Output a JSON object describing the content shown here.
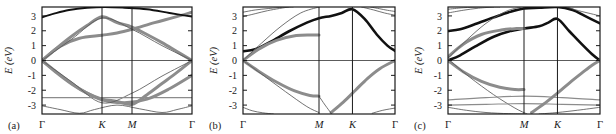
{
  "figure": {
    "type": "band-structure-figure",
    "panel_count": 3,
    "background_color": "#ffffff"
  },
  "axes": {
    "ylabel": "E (eV)",
    "yticks": [
      "3",
      "2",
      "1",
      "0",
      "-1",
      "-2",
      "-3"
    ],
    "ytick_values": [
      3,
      2,
      1,
      0,
      -1,
      -2,
      -3
    ],
    "ylim": [
      -3.6,
      3.6
    ],
    "tick_color": "#1a1a1a",
    "frame_color": "#1a1a1a",
    "band_gray": "#8c8c8c",
    "band_dark": "#111111",
    "thin_line": "#5a5a5a"
  },
  "panels": [
    {
      "id": "a",
      "tag": "(a)",
      "xticks": [
        "Γ",
        "K",
        "M",
        "Γ"
      ],
      "xtick_fracs": [
        0,
        0.4,
        0.6,
        1.0
      ],
      "chart_data": {
        "type": "line",
        "title": "",
        "xlabel": "",
        "ylabel": "E (eV)",
        "ylim": [
          -3.6,
          3.6
        ],
        "xlim": [
          0,
          1
        ],
        "grid": false,
        "xticklabels": [
          "Γ",
          "K",
          "M",
          "Γ"
        ],
        "xtickpos": [
          0,
          0.4,
          0.6,
          1.0
        ],
        "legend": "none",
        "series": [
          {
            "name": "dirac-upper-gray",
            "style": "thick-gray",
            "x": [
              0.0,
              0.1,
              0.2,
              0.3,
              0.4,
              0.5,
              0.6,
              0.7,
              0.8,
              0.9,
              1.0
            ],
            "y": [
              0.0,
              0.85,
              1.65,
              2.35,
              2.95,
              2.55,
              2.25,
              1.75,
              1.2,
              0.6,
              0.0
            ]
          },
          {
            "name": "dirac-lower-gray",
            "style": "thick-gray",
            "x": [
              0.0,
              0.1,
              0.2,
              0.3,
              0.4,
              0.5,
              0.6,
              0.7,
              0.8,
              0.9,
              1.0
            ],
            "y": [
              0.0,
              -0.85,
              -1.6,
              -2.2,
              -2.6,
              -2.75,
              -2.95,
              -2.3,
              -1.55,
              -0.8,
              0.0
            ]
          },
          {
            "name": "flat-band-gray",
            "style": "thick-gray",
            "x": [
              0.0,
              0.12,
              0.25,
              0.4,
              0.5,
              0.6,
              0.75,
              0.88,
              1.0
            ],
            "y": [
              0.0,
              0.95,
              1.5,
              1.7,
              1.85,
              2.1,
              2.55,
              2.9,
              3.25
            ]
          },
          {
            "name": "mid-gray-cross",
            "style": "thick-gray",
            "x": [
              0.0,
              0.12,
              0.25,
              0.4,
              0.55,
              0.7,
              0.85,
              1.0
            ],
            "y": [
              0.0,
              -0.95,
              -1.9,
              -2.65,
              -2.85,
              -2.6,
              -1.9,
              -1.0
            ]
          },
          {
            "name": "upper-dark",
            "style": "dark",
            "x": [
              0.0,
              0.08,
              0.18,
              0.3,
              0.42,
              0.55,
              0.7,
              0.85,
              1.0
            ],
            "y": [
              2.9,
              3.15,
              3.4,
              3.55,
              3.6,
              3.55,
              3.45,
              3.2,
              2.95
            ]
          },
          {
            "name": "steep-thin-1",
            "style": "thin",
            "x": [
              0.0,
              0.2,
              0.4,
              0.6,
              0.8,
              1.0
            ],
            "y": [
              0.0,
              1.45,
              2.85,
              2.1,
              1.0,
              0.0
            ]
          },
          {
            "name": "steep-thin-2",
            "style": "thin",
            "x": [
              0.0,
              0.2,
              0.4,
              0.6,
              0.8,
              1.0
            ],
            "y": [
              0.0,
              -1.45,
              -2.85,
              -2.2,
              -1.05,
              0.0
            ]
          },
          {
            "name": "lower-thin-dip",
            "style": "thin",
            "x": [
              0.0,
              0.12,
              0.25,
              0.35,
              0.5,
              0.65,
              0.8,
              0.9,
              1.0
            ],
            "y": [
              -3.05,
              -3.3,
              -3.55,
              -3.3,
              -3.0,
              -3.25,
              -3.5,
              -3.3,
              -3.05
            ]
          },
          {
            "name": "flat-gray-line",
            "style": "thin-gray-flat",
            "x": [
              0.0,
              1.0
            ],
            "y": [
              -2.5,
              -2.5
            ]
          },
          {
            "name": "fermi-line",
            "style": "zero-line",
            "x": [
              0.0,
              1.0
            ],
            "y": [
              0.0,
              0.0
            ]
          }
        ]
      }
    },
    {
      "id": "b",
      "tag": "(b)",
      "xticks": [
        "Γ",
        "M",
        "K",
        "Γ"
      ],
      "xtick_fracs": [
        0,
        0.5,
        0.72,
        1.0
      ],
      "chart_data": {
        "type": "line",
        "title": "",
        "xlabel": "",
        "ylabel": "E (eV)",
        "ylim": [
          -3.6,
          3.6
        ],
        "xlim": [
          0,
          1
        ],
        "grid": false,
        "xticklabels": [
          "Γ",
          "M",
          "K",
          "Γ"
        ],
        "xtickpos": [
          0,
          0.5,
          0.72,
          1.0
        ],
        "legend": "none",
        "series": [
          {
            "name": "main-dark-band",
            "style": "dark-thick",
            "x": [
              0.0,
              0.08,
              0.18,
              0.3,
              0.42,
              0.5,
              0.58,
              0.65,
              0.72,
              0.8,
              0.88,
              0.95,
              1.0
            ],
            "y": [
              0.62,
              0.75,
              1.25,
              1.95,
              2.55,
              2.85,
              3.0,
              3.2,
              3.45,
              2.8,
              1.75,
              1.0,
              0.65
            ]
          },
          {
            "name": "gray-flat-1p7",
            "style": "thick-gray",
            "x": [
              0.0,
              0.1,
              0.22,
              0.35,
              0.46,
              0.5
            ],
            "y": [
              0.0,
              0.75,
              1.35,
              1.68,
              1.72,
              1.72
            ]
          },
          {
            "name": "gray-descend",
            "style": "thick-gray",
            "x": [
              0.0,
              0.1,
              0.22,
              0.34,
              0.44,
              0.5
            ],
            "y": [
              0.0,
              -0.7,
              -1.45,
              -2.05,
              -2.35,
              -2.4
            ]
          },
          {
            "name": "gray-rise-right",
            "style": "thick-gray",
            "x": [
              0.58,
              0.66,
              0.74,
              0.82,
              0.9,
              1.0
            ],
            "y": [
              -3.5,
              -2.8,
              -2.0,
              -1.2,
              -0.55,
              0.0
            ]
          },
          {
            "name": "thin-steep-left",
            "style": "thin",
            "x": [
              0.0,
              0.12,
              0.25,
              0.38,
              0.5
            ],
            "y": [
              0.0,
              1.15,
              2.3,
              3.2,
              3.6
            ]
          },
          {
            "name": "thin-steep-left2",
            "style": "thin",
            "x": [
              0.0,
              0.14,
              0.28,
              0.42,
              0.5
            ],
            "y": [
              0.0,
              -1.05,
              -2.1,
              -3.1,
              -3.5
            ]
          },
          {
            "name": "thin-arc-topleft",
            "style": "thin",
            "x": [
              0.0,
              0.08,
              0.16,
              0.24,
              0.3
            ],
            "y": [
              2.95,
              3.15,
              3.35,
              3.5,
              3.6
            ]
          },
          {
            "name": "thin-arc-topleft2",
            "style": "thin",
            "x": [
              0.0,
              0.08,
              0.17,
              0.26,
              0.33
            ],
            "y": [
              3.25,
              3.4,
              3.5,
              3.58,
              3.6
            ]
          },
          {
            "name": "thin-arc-topright",
            "style": "thin",
            "x": [
              0.78,
              0.86,
              0.93,
              1.0
            ],
            "y": [
              3.6,
              3.4,
              3.2,
              3.05
            ]
          },
          {
            "name": "thin-arc-topright2",
            "style": "thin",
            "x": [
              0.84,
              0.9,
              0.95,
              1.0
            ],
            "y": [
              3.6,
              3.48,
              3.38,
              3.3
            ]
          },
          {
            "name": "thin-bottom-left",
            "style": "thin",
            "x": [
              0.0,
              0.06,
              0.13,
              0.2
            ],
            "y": [
              -3.15,
              -3.38,
              -3.52,
              -3.6
            ]
          },
          {
            "name": "thin-bottom-right",
            "style": "thin",
            "x": [
              0.85,
              0.92,
              1.0
            ],
            "y": [
              -3.55,
              -3.35,
              -3.2
            ]
          },
          {
            "name": "thin-dip-mid",
            "style": "thin",
            "x": [
              0.5,
              0.54,
              0.58
            ],
            "y": [
              -2.4,
              -3.0,
              -3.55
            ]
          },
          {
            "name": "fermi-line",
            "style": "zero-line",
            "x": [
              0.0,
              1.0
            ],
            "y": [
              0.0,
              0.0
            ]
          }
        ]
      }
    },
    {
      "id": "c",
      "tag": "(c)",
      "xticks": [
        "Γ",
        "M",
        "K",
        "Γ"
      ],
      "xtick_fracs": [
        0,
        0.5,
        0.72,
        1.0
      ],
      "chart_data": {
        "type": "line",
        "title": "",
        "xlabel": "",
        "ylabel": "E (eV)",
        "ylim": [
          -3.6,
          3.6
        ],
        "xlim": [
          0,
          1
        ],
        "grid": false,
        "xticklabels": [
          "Γ",
          "M",
          "K",
          "Γ"
        ],
        "xtickpos": [
          0,
          0.5,
          0.72,
          1.0
        ],
        "legend": "none",
        "series": [
          {
            "name": "dark-band-upper",
            "style": "dark-thick",
            "x": [
              0.0,
              0.08,
              0.18,
              0.3,
              0.4,
              0.5,
              0.6,
              0.72,
              0.82,
              0.9,
              1.0
            ],
            "y": [
              1.98,
              2.1,
              2.45,
              2.9,
              3.25,
              3.5,
              3.55,
              3.6,
              3.4,
              3.0,
              2.5
            ]
          },
          {
            "name": "dark-band-lower",
            "style": "dark-thick",
            "x": [
              0.0,
              0.08,
              0.18,
              0.3,
              0.4,
              0.5,
              0.6,
              0.66,
              0.72,
              0.8,
              0.88,
              0.95,
              1.0
            ],
            "y": [
              0.0,
              0.35,
              0.95,
              1.6,
              1.95,
              2.15,
              2.3,
              2.55,
              2.8,
              1.95,
              1.1,
              0.4,
              0.0
            ]
          },
          {
            "name": "gray-flat-2",
            "style": "thick-gray",
            "x": [
              0.0,
              0.1,
              0.22,
              0.35,
              0.45,
              0.5
            ],
            "y": [
              0.25,
              1.1,
              1.75,
              2.05,
              2.15,
              2.15
            ]
          },
          {
            "name": "gray-descend-c",
            "style": "thick-gray",
            "x": [
              0.0,
              0.1,
              0.22,
              0.34,
              0.44,
              0.5
            ],
            "y": [
              0.0,
              -0.75,
              -1.4,
              -1.8,
              -1.95,
              -1.95
            ]
          },
          {
            "name": "gray-rise-right-c",
            "style": "thick-gray",
            "x": [
              0.55,
              0.64,
              0.72,
              0.8,
              0.88,
              0.95,
              1.0
            ],
            "y": [
              -3.5,
              -2.85,
              -2.2,
              -1.5,
              -0.85,
              -0.3,
              0.0
            ]
          },
          {
            "name": "thin-steep-left-c",
            "style": "thin",
            "x": [
              0.0,
              0.12,
              0.25,
              0.38,
              0.48
            ],
            "y": [
              0.15,
              1.35,
              2.5,
              3.3,
              3.6
            ]
          },
          {
            "name": "thin-steep-down-c",
            "style": "thin",
            "x": [
              0.0,
              0.14,
              0.3,
              0.44,
              0.52
            ],
            "y": [
              0.1,
              -1.1,
              -2.3,
              -3.2,
              -3.6
            ]
          },
          {
            "name": "thin-top-arc-c1",
            "style": "thin",
            "x": [
              0.0,
              0.1,
              0.2,
              0.3
            ],
            "y": [
              3.2,
              3.38,
              3.52,
              3.6
            ]
          },
          {
            "name": "thin-top-arc-c2",
            "style": "thin",
            "x": [
              0.0,
              0.1,
              0.22,
              0.34
            ],
            "y": [
              3.45,
              3.55,
              3.6,
              3.6
            ]
          },
          {
            "name": "thin-top-right-c",
            "style": "thin",
            "x": [
              0.78,
              0.86,
              0.94,
              1.0
            ],
            "y": [
              3.6,
              3.35,
              3.15,
              3.0
            ]
          },
          {
            "name": "gray-flat-neg26",
            "style": "thin-gray-flat",
            "x": [
              0.0,
              0.25,
              0.5,
              0.75,
              1.0
            ],
            "y": [
              -2.65,
              -2.5,
              -2.4,
              -2.5,
              -2.65
            ]
          },
          {
            "name": "gray-flat-neg30",
            "style": "thin-gray-flat",
            "x": [
              0.0,
              0.25,
              0.5,
              0.75,
              1.0
            ],
            "y": [
              -3.0,
              -2.95,
              -2.9,
              -2.95,
              -3.0
            ]
          },
          {
            "name": "thin-bottom-c1",
            "style": "thin",
            "x": [
              0.0,
              0.12,
              0.25,
              0.4,
              0.5
            ],
            "y": [
              -3.15,
              -3.35,
              -3.5,
              -3.58,
              -3.6
            ]
          },
          {
            "name": "thin-bottom-c2",
            "style": "thin",
            "x": [
              0.6,
              0.72,
              0.85,
              1.0
            ],
            "y": [
              -3.6,
              -3.5,
              -3.35,
              -3.15
            ]
          },
          {
            "name": "fermi-line",
            "style": "zero-line",
            "x": [
              0.0,
              1.0
            ],
            "y": [
              0.0,
              0.0
            ]
          }
        ]
      }
    }
  ]
}
